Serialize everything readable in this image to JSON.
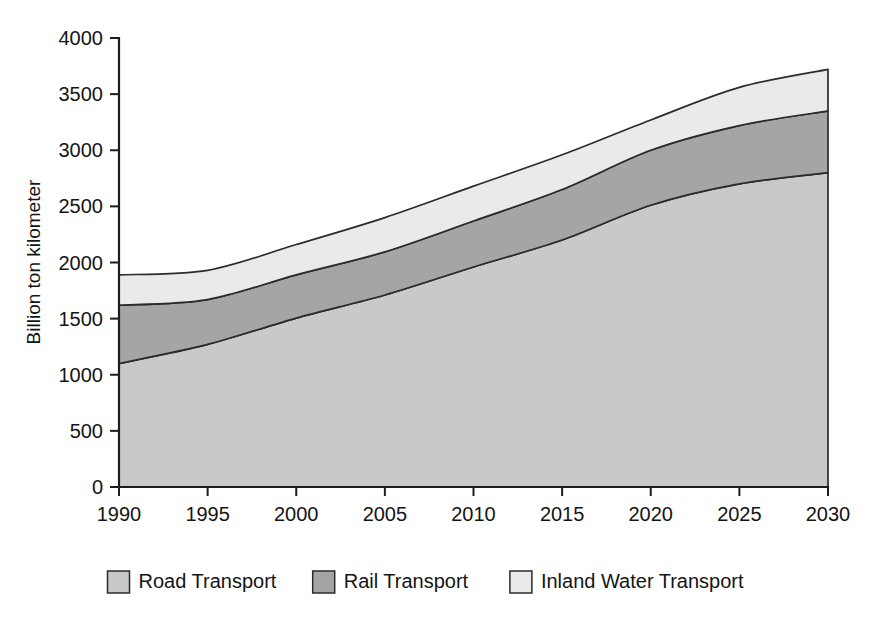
{
  "chart_data": {
    "type": "area",
    "stacked": true,
    "title": "",
    "subtitle": "",
    "xlabel": "",
    "ylabel": "Billion ton kilometer",
    "x": [
      1990,
      1995,
      2000,
      2005,
      2010,
      2015,
      2020,
      2025,
      2030
    ],
    "categories": [
      "1990",
      "1995",
      "2000",
      "2005",
      "2010",
      "2015",
      "2020",
      "2025",
      "2030"
    ],
    "series": [
      {
        "name": "Road Transport",
        "color": "#c9c9c9",
        "values": [
          1100,
          1270,
          1505,
          1710,
          1960,
          2200,
          2510,
          2700,
          2800
        ],
        "cumulative": [
          1100,
          1270,
          1505,
          1710,
          1960,
          2200,
          2510,
          2700,
          2800
        ]
      },
      {
        "name": "Rail Transport",
        "color": "#a5a5a5",
        "values": [
          520,
          400,
          385,
          385,
          410,
          450,
          490,
          520,
          550
        ],
        "cumulative": [
          1620,
          1670,
          1890,
          2095,
          2370,
          2650,
          3000,
          3220,
          3350
        ]
      },
      {
        "name": "Inland Water Transport",
        "color": "#eaeaea",
        "values": [
          270,
          260,
          270,
          305,
          310,
          310,
          270,
          340,
          370
        ],
        "cumulative": [
          1890,
          1930,
          2160,
          2400,
          2680,
          2960,
          3270,
          3560,
          3720
        ]
      }
    ],
    "xlim": [
      1990,
      2030
    ],
    "ylim": [
      0,
      4000
    ],
    "yticks": [
      0,
      500,
      1000,
      1500,
      2000,
      2500,
      3000,
      3500,
      4000
    ],
    "ytick_labels": [
      "0",
      "500",
      "1000",
      "1500",
      "2000",
      "2500",
      "3000",
      "3500",
      "4000"
    ],
    "xticks": [
      1990,
      1995,
      2000,
      2005,
      2010,
      2015,
      2020,
      2025,
      2030
    ],
    "xtick_labels": [
      "1990",
      "1995",
      "2000",
      "2005",
      "2010",
      "2015",
      "2020",
      "2025",
      "2030"
    ],
    "grid": false,
    "legend_position": "bottom"
  },
  "legend": {
    "items": [
      {
        "label": "Road Transport",
        "color": "#c9c9c9"
      },
      {
        "label": "Rail Transport",
        "color": "#a5a5a5"
      },
      {
        "label": "Inland Water Transport",
        "color": "#eaeaea"
      }
    ]
  },
  "axes": {
    "y_title": "Billion ton kilometer"
  }
}
